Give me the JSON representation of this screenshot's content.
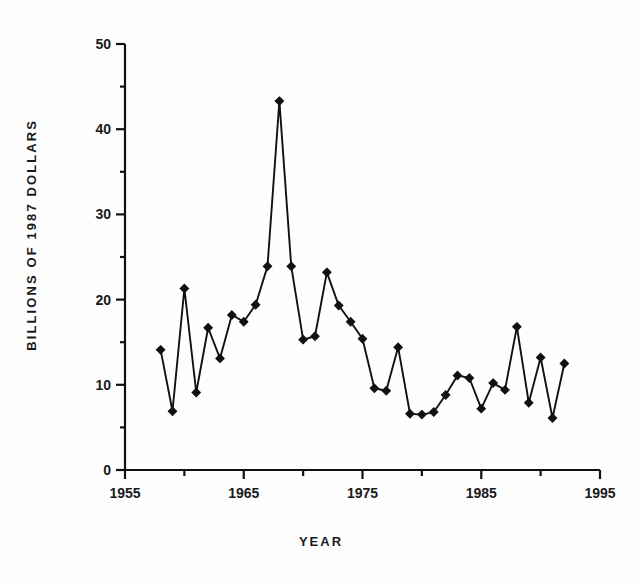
{
  "chart_data": {
    "type": "line",
    "title": "",
    "xlabel": "YEAR",
    "ylabel": "BILLIONS OF 1987 DOLLARS",
    "xlim": [
      1955,
      1995
    ],
    "ylim": [
      0,
      50
    ],
    "grid": false,
    "legend": null,
    "x_major_ticks": [
      1955,
      1965,
      1975,
      1985,
      1995
    ],
    "x_minor_ticks": [
      1960,
      1970,
      1980,
      1990
    ],
    "x_tick_labels": [
      "1955",
      "1965",
      "1975",
      "1985",
      "1995"
    ],
    "y_major_ticks": [
      0,
      10,
      20,
      30,
      40,
      50
    ],
    "y_minor_ticks": [
      5,
      15,
      25,
      35,
      45
    ],
    "y_tick_labels": [
      "0",
      "10",
      "20",
      "30",
      "40",
      "50"
    ],
    "marker": "diamond",
    "marker_color": "#111111",
    "line_color": "#111111",
    "x": [
      1958,
      1959,
      1960,
      1961,
      1962,
      1963,
      1964,
      1965,
      1966,
      1967,
      1968,
      1969,
      1970,
      1971,
      1972,
      1973,
      1974,
      1975,
      1976,
      1977,
      1978,
      1979,
      1980,
      1981,
      1982,
      1983,
      1984,
      1985,
      1986,
      1987,
      1988,
      1989,
      1990,
      1991,
      1992
    ],
    "values": [
      14.1,
      6.9,
      21.3,
      9.1,
      16.7,
      13.1,
      18.2,
      17.4,
      19.4,
      23.9,
      43.3,
      23.9,
      15.3,
      15.7,
      23.2,
      19.3,
      17.4,
      15.4,
      9.6,
      9.3,
      14.4,
      6.6,
      6.5,
      6.8,
      8.8,
      11.1,
      10.8,
      7.2,
      10.2,
      9.4,
      16.8,
      7.9,
      13.2,
      6.1,
      12.5
    ],
    "series": [
      {
        "name": "value",
        "values": [
          14.1,
          6.9,
          21.3,
          9.1,
          16.7,
          13.1,
          18.2,
          17.4,
          19.4,
          23.9,
          43.3,
          23.9,
          15.3,
          15.7,
          23.2,
          19.3,
          17.4,
          15.4,
          9.6,
          9.3,
          14.4,
          6.6,
          6.5,
          6.8,
          8.8,
          11.1,
          10.8,
          7.2,
          10.2,
          9.4,
          16.8,
          7.9,
          13.2,
          6.1,
          12.5
        ]
      }
    ],
    "annotations": []
  },
  "axes": {
    "x_title": "YEAR",
    "y_title": "BILLIONS OF 1987 DOLLARS"
  }
}
